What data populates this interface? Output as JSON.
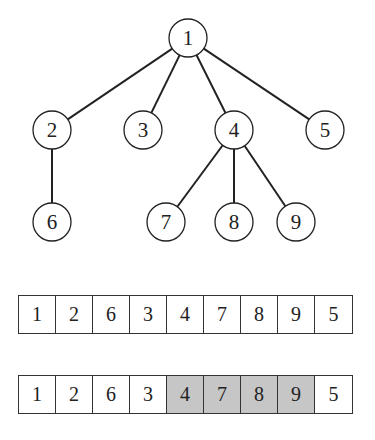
{
  "tree": {
    "nodes": [
      {
        "id": "1",
        "x": 188,
        "y": 38
      },
      {
        "id": "2",
        "x": 52,
        "y": 130
      },
      {
        "id": "3",
        "x": 143,
        "y": 130
      },
      {
        "id": "4",
        "x": 234,
        "y": 130
      },
      {
        "id": "5",
        "x": 325,
        "y": 130
      },
      {
        "id": "6",
        "x": 52,
        "y": 222
      },
      {
        "id": "7",
        "x": 166,
        "y": 222
      },
      {
        "id": "8",
        "x": 234,
        "y": 222
      },
      {
        "id": "9",
        "x": 296,
        "y": 222
      }
    ],
    "edges": [
      [
        "1",
        "2"
      ],
      [
        "1",
        "3"
      ],
      [
        "1",
        "4"
      ],
      [
        "1",
        "5"
      ],
      [
        "2",
        "6"
      ],
      [
        "4",
        "7"
      ],
      [
        "4",
        "8"
      ],
      [
        "4",
        "9"
      ]
    ]
  },
  "arrays": [
    {
      "values": [
        "1",
        "2",
        "6",
        "3",
        "4",
        "7",
        "8",
        "9",
        "5"
      ],
      "highlight": []
    },
    {
      "values": [
        "1",
        "2",
        "6",
        "3",
        "4",
        "7",
        "8",
        "9",
        "5"
      ],
      "highlight": [
        4,
        5,
        6,
        7
      ]
    }
  ],
  "colors": {
    "highlight": "#c6c6c6",
    "stroke": "#222222"
  }
}
